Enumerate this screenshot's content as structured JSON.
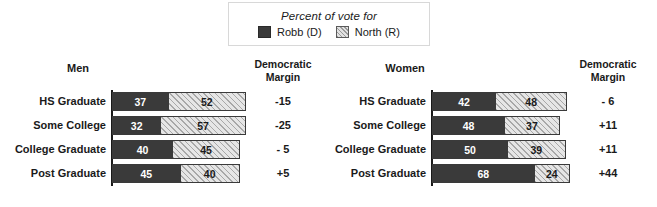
{
  "legend": {
    "title": "Percent of vote for",
    "items": [
      {
        "label": "Robb (D)",
        "swatch": "dark-solid-swatch",
        "color": "#3a3a3a"
      },
      {
        "label": "North (R)",
        "swatch": "light-hatched-swatch",
        "color": "#e6e6e6"
      }
    ]
  },
  "panels": [
    {
      "title": "Men",
      "margin_header_line1": "Democratic",
      "margin_header_line2": "Margin",
      "rows": [
        {
          "label": "HS Graduate",
          "dem": 37,
          "rep": 52,
          "margin": "-15"
        },
        {
          "label": "Some College",
          "dem": 32,
          "rep": 57,
          "margin": "-25"
        },
        {
          "label": "College Graduate",
          "dem": 40,
          "rep": 45,
          "margin": "- 5"
        },
        {
          "label": "Post Graduate",
          "dem": 45,
          "rep": 40,
          "margin": "+5"
        }
      ]
    },
    {
      "title": "Women",
      "margin_header_line1": "Democratic",
      "margin_header_line2": "Margin",
      "rows": [
        {
          "label": "HS Graduate",
          "dem": 42,
          "rep": 48,
          "margin": "- 6"
        },
        {
          "label": "Some College",
          "dem": 48,
          "rep": 37,
          "margin": "+11"
        },
        {
          "label": "College Graduate",
          "dem": 50,
          "rep": 39,
          "margin": "+11"
        },
        {
          "label": "Post Graduate",
          "dem": 68,
          "rep": 24,
          "margin": "+44"
        }
      ]
    }
  ],
  "chart_data": {
    "type": "bar",
    "title": "Percent of vote for",
    "subtitle": "",
    "xlabel": "Percent of vote",
    "ylabel": "Education level",
    "xlim": [
      0,
      100
    ],
    "grid": false,
    "legend_position": "top-center",
    "orientation": "horizontal",
    "stacked": true,
    "panels": [
      {
        "name": "Men",
        "categories": [
          "HS Graduate",
          "Some College",
          "College Graduate",
          "Post Graduate"
        ],
        "series": [
          {
            "name": "Robb (D)",
            "values": [
              37,
              32,
              40,
              45
            ]
          },
          {
            "name": "North (R)",
            "values": [
              52,
              57,
              45,
              40
            ]
          }
        ],
        "annotations": {
          "column": "Democratic Margin",
          "values": [
            "-15",
            "-25",
            "- 5",
            "+5"
          ]
        }
      },
      {
        "name": "Women",
        "categories": [
          "HS Graduate",
          "Some College",
          "College Graduate",
          "Post Graduate"
        ],
        "series": [
          {
            "name": "Robb (D)",
            "values": [
              42,
              48,
              50,
              68
            ]
          },
          {
            "name": "North (R)",
            "values": [
              48,
              37,
              39,
              24
            ]
          }
        ],
        "annotations": {
          "column": "Democratic Margin",
          "values": [
            "- 6",
            "+11",
            "+11",
            "+44"
          ]
        }
      }
    ]
  }
}
